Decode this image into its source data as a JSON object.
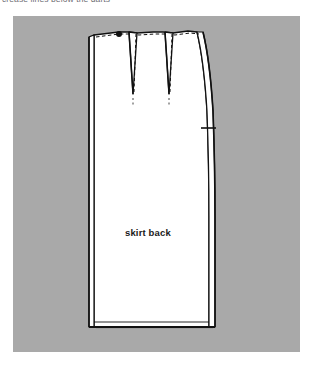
{
  "figure": {
    "caption": "crease lines below the darts",
    "panel": {
      "background_color": "#a9a9a9",
      "x": 13,
      "y": 16,
      "width": 287,
      "height": 336
    }
  },
  "pattern": {
    "piece_label": "skirt back",
    "fill_color": "#ffffff",
    "outline_color": "#111111",
    "shadow_color": "#3a3a3a",
    "stitch_line_style": "dashed",
    "darts": [
      {
        "name": "dart-left",
        "apex_label": "",
        "stitch": "dashed"
      },
      {
        "name": "dart-right",
        "apex_label": "",
        "stitch": "dashed"
      }
    ],
    "marks": [
      {
        "name": "waist-notch",
        "type": "dot"
      },
      {
        "name": "side-seam-notch",
        "type": "tick"
      }
    ]
  },
  "colors": {
    "panel_gray": "#a9a9a9",
    "paper_white": "#ffffff",
    "ink_black": "#111111",
    "caption_gray": "#6e6e74"
  }
}
